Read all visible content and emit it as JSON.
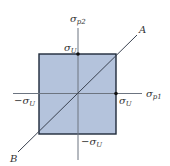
{
  "diagram": {
    "type": "failure-envelope",
    "colors": {
      "region_fill": "#b4c3dc",
      "region_stroke": "#1e2a3a",
      "axis": "#6c7480",
      "line": "#3a4250",
      "point": "#111111"
    },
    "labels": {
      "y_axis": "σ",
      "y_axis_sub": "p2",
      "x_axis": "σ",
      "x_axis_sub": "p1",
      "top_value": "σ",
      "top_value_sub": "U",
      "right_value": "σ",
      "right_value_sub": "U",
      "left_value": "−σ",
      "left_value_sub": "U",
      "bottom_value": "−σ",
      "bottom_value_sub": "U",
      "line_end_a": "A",
      "line_end_b": "B"
    }
  }
}
